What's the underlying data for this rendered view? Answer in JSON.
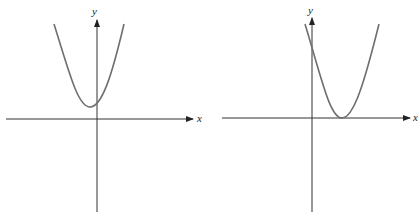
{
  "graphs": [
    {
      "id": "left",
      "x_axis_label": "x",
      "y_axis_label": "y",
      "description": "Upward parabola with vertex above the x-axis, slightly left of the y-axis; no real roots"
    },
    {
      "id": "right",
      "x_axis_label": "x",
      "y_axis_label": "y",
      "description": "Upward parabola with vertex touching the x-axis to the right of the y-axis; one repeated root"
    }
  ],
  "colors": {
    "axis": "#333333",
    "curve": "#6e6e6e",
    "background": "#ffffff"
  }
}
